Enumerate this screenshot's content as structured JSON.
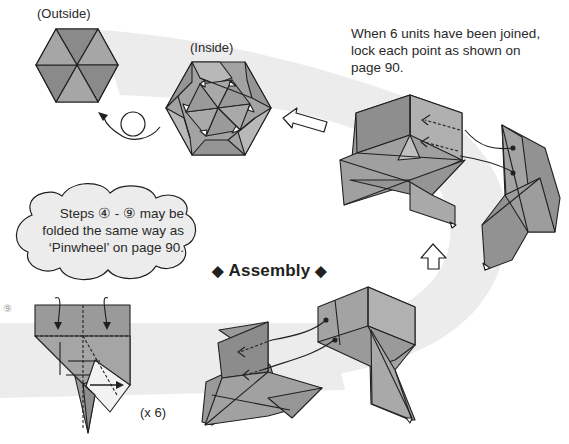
{
  "diagram": {
    "title": "Assembly",
    "title_decoration": "◆",
    "labels": {
      "outside": "(Outside)",
      "inside": "(Inside)",
      "multiplier": "(x 6)",
      "step_number": "⑨"
    },
    "instruction": {
      "line1": "When 6 units have been joined,",
      "line2": "lock each point as shown on",
      "line3": "page 90."
    },
    "note_cloud": {
      "line1": "Steps ④ - ⑨ may be",
      "line2": "folded the same way as",
      "line3": "‘Pinwheel’ on page 90."
    },
    "icons": {
      "turn_over": "turn-over-arrow-icon",
      "flow_left": "hollow-arrow-left-icon",
      "flow_up": "hollow-arrow-up-icon",
      "diamond": "diamond-icon"
    },
    "colors": {
      "paper_dark": "#8f8f8f",
      "paper_mid": "#a3a3a3",
      "paper_light": "#b6b6b6",
      "band": "#ececec",
      "line": "#231f20"
    }
  }
}
